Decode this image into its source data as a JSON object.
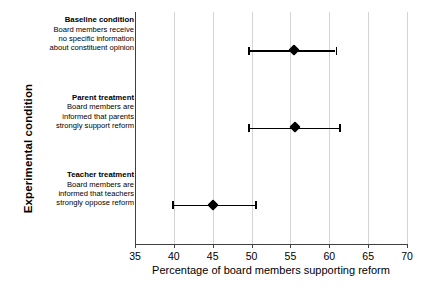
{
  "chart_data": {
    "type": "scatter",
    "title": "",
    "subtitle": "",
    "xlabel": "Percentage of board members supporting reform",
    "ylabel": "Experimental condition",
    "xlim": [
      35,
      70
    ],
    "ylim": [
      0,
      3
    ],
    "xticks": [
      35,
      40,
      45,
      50,
      55,
      60,
      65,
      70
    ],
    "xticklabels": [
      "35",
      "40",
      "45",
      "50",
      "55",
      "60",
      "65",
      "70"
    ],
    "grid": "vertical",
    "legend": "none",
    "orientation": "horizontal",
    "marker": "diamond",
    "marker_color": "#000000",
    "errorbar_color": "#000000",
    "errorbar_style": "capped",
    "gridline_color": "#d4d4d4",
    "axis_color": "#404040",
    "categories": [
      {
        "title": "Baseline condition",
        "sublines": [
          "Board members receive",
          "no specific information",
          "about constituent opinion"
        ],
        "value": 55.4,
        "ci_low": 49.6,
        "ci_high": 60.8
      },
      {
        "title": "Parent treatment",
        "sublines": [
          "Board members are",
          "informed that parents",
          "strongly support reform"
        ],
        "value": 55.6,
        "ci_low": 49.6,
        "ci_high": 61.3
      },
      {
        "title": "Teacher treatment",
        "sublines": [
          "Board members are",
          "informed that teachers",
          "strongly oppose reform"
        ],
        "value": 45.0,
        "ci_low": 39.8,
        "ci_high": 50.5
      }
    ]
  }
}
